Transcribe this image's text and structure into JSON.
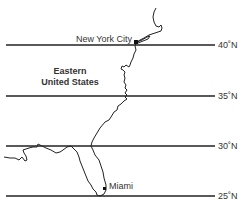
{
  "map": {
    "region": {
      "line1": "Eastern",
      "line2": "United States"
    },
    "cities": [
      {
        "name": "New York City"
      },
      {
        "name": "Miami"
      }
    ],
    "latitudes": [
      {
        "label": "40˚N"
      },
      {
        "label": "35˚N"
      },
      {
        "label": "30˚N"
      },
      {
        "label": "25˚N"
      }
    ],
    "colors": {
      "line": "#222222",
      "text": "#333333",
      "background": "#ffffff"
    }
  }
}
